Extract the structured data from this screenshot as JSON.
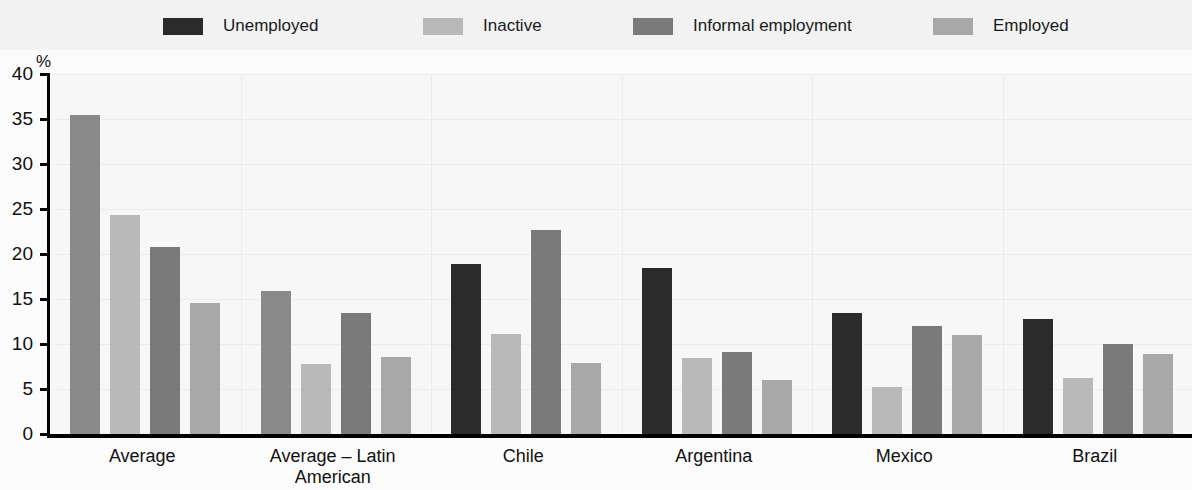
{
  "legend": {
    "items": [
      {
        "label": "Unemployed",
        "color": "#2b2b2b"
      },
      {
        "label": "Inactive",
        "color": "#b9b9b9"
      },
      {
        "label": "Informal employment",
        "color": "#7a7a7a"
      },
      {
        "label": "Employed",
        "color": "#a8a8a8"
      }
    ]
  },
  "axis": {
    "y_unit": "%",
    "y_ticks": [
      "40",
      "35",
      "30",
      "25",
      "20",
      "15",
      "10",
      "5",
      "0"
    ]
  },
  "chart_data": {
    "type": "bar",
    "title": "",
    "xlabel": "",
    "ylabel": "%",
    "ylim": [
      0,
      40
    ],
    "ytick_step": 5,
    "grid": true,
    "legend_position": "top",
    "categories": [
      "Average",
      "Average – Latin American countries",
      "Chile",
      "Argentina",
      "Mexico",
      "Brazil"
    ],
    "category_lines": [
      [
        "Average"
      ],
      [
        "Average – Latin American",
        "countries"
      ],
      [
        "Chile"
      ],
      [
        "Argentina"
      ],
      [
        "Mexico"
      ],
      [
        "Brazil"
      ]
    ],
    "series": [
      {
        "name": "Unemployed",
        "color": "#2b2b2b",
        "values": [
          35.5,
          15.9,
          18.9,
          18.4,
          13.4,
          12.8
        ]
      },
      {
        "name": "Inactive",
        "color": "#b9b9b9",
        "values": [
          24.3,
          7.8,
          11.1,
          8.4,
          5.2,
          6.2
        ]
      },
      {
        "name": "Informal employment",
        "color": "#7a7a7a",
        "values": [
          20.8,
          13.5,
          22.7,
          9.1,
          12.0,
          10.0
        ]
      },
      {
        "name": "Employed",
        "color": "#a8a8a8",
        "values": [
          14.6,
          8.6,
          7.9,
          6.0,
          11.0,
          8.9
        ]
      }
    ],
    "bar_color_overrides": {
      "note": "In the two Average groups the first (Unemployed) bar is rendered mid-grey, not black",
      "entries": [
        {
          "group_index": 0,
          "series_index": 0,
          "color": "#8a8a8a"
        },
        {
          "group_index": 1,
          "series_index": 0,
          "color": "#8a8a8a"
        }
      ]
    }
  }
}
